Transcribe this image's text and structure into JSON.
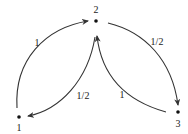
{
  "diagram": {
    "type": "markov-chain",
    "nodes": [
      {
        "id": "1",
        "label": "1",
        "x": 19,
        "y": 117,
        "label_x": 19,
        "label_y": 130
      },
      {
        "id": "2",
        "label": "2",
        "x": 96,
        "y": 20,
        "label_x": 96,
        "label_y": 12
      },
      {
        "id": "3",
        "label": "3",
        "x": 179,
        "y": 113,
        "label_x": 179,
        "label_y": 127
      }
    ],
    "edges": [
      {
        "from": "1",
        "to": "2",
        "weight": "1"
      },
      {
        "from": "2",
        "to": "3",
        "weight": "1/2"
      },
      {
        "from": "2",
        "to": "1",
        "weight": "1/2"
      },
      {
        "from": "3",
        "to": "2",
        "weight": "1"
      }
    ],
    "colors": {
      "stroke": "#333333",
      "node": "#111111",
      "text": "#222222",
      "background": "#ffffff"
    }
  }
}
